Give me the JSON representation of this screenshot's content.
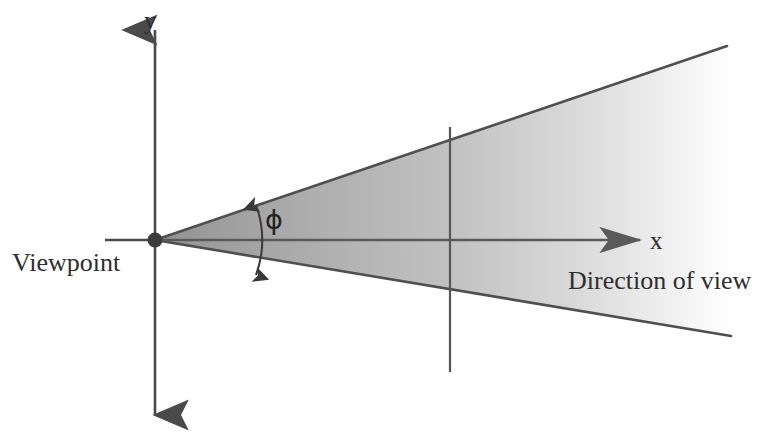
{
  "figure": {
    "background_color": "#ffffff",
    "ink_color": "#4a4a4a",
    "text_color": "#2e2e2e"
  },
  "labels": {
    "y_axis": "y",
    "x_axis": "x",
    "viewpoint": "Viewpoint",
    "direction_of_view": "Direction of view",
    "angle_symbol": "ϕ"
  },
  "icons": {
    "origin_point": "origin-dot",
    "y_arrow_up": "arrowhead-up",
    "y_arrow_down": "arrowhead-down",
    "x_arrow_right": "arrowhead-right",
    "angle_arc": "double-headed-arc"
  },
  "geometry": {
    "origin": {
      "x": 155,
      "y": 240
    },
    "y_axis": {
      "top": 22,
      "bottom": 425
    },
    "x_axis": {
      "left": 105,
      "right": 642
    },
    "cone": {
      "apex": {
        "x": 155,
        "y": 240
      },
      "upper_edge_end": {
        "x": 727,
        "y": 46
      },
      "lower_edge_end": {
        "x": 731,
        "y": 336
      },
      "half_angle_deg": 11.5,
      "fill_start_color": "#959595",
      "fill_end_color": "#ffffff",
      "outline_color": "#4f4f4f"
    },
    "reference_line": {
      "x": 450,
      "top": 127,
      "bottom": 372
    },
    "angle_arc": {
      "center_x": 155,
      "center_y": 240,
      "radius": 103
    }
  }
}
